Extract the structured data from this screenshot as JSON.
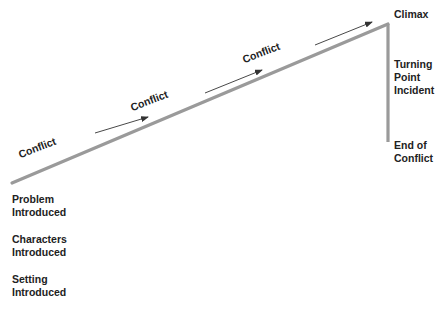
{
  "diagram": {
    "type": "plot-structure-line",
    "colors": {
      "line": "#9a9a9a",
      "arrow": "#333333",
      "text": "#222222",
      "background": "#ffffff"
    },
    "points": {
      "start": [
        12,
        183
      ],
      "climax": [
        388,
        24
      ],
      "end": [
        388,
        142
      ]
    },
    "conflicts": [
      {
        "label": "Conflict",
        "text_x": 21,
        "text_y": 160,
        "arrow_from": [
          95,
          133
        ],
        "arrow_to": [
          148,
          117
        ]
      },
      {
        "label": "Conflict",
        "text_x": 133,
        "text_y": 113,
        "arrow_from": [
          205,
          93
        ],
        "arrow_to": [
          262,
          70
        ]
      },
      {
        "label": "Conflict",
        "text_x": 245,
        "text_y": 64,
        "arrow_from": [
          315,
          45
        ],
        "arrow_to": [
          372,
          22
        ]
      }
    ],
    "left_labels": [
      {
        "lines": [
          "Problem",
          "Introduced"
        ]
      },
      {
        "lines": [
          "Characters",
          "Introduced"
        ]
      },
      {
        "lines": [
          "Setting",
          "Introduced"
        ]
      }
    ],
    "right_labels": {
      "climax": {
        "lines": [
          "Climax"
        ]
      },
      "turning_point": {
        "lines": [
          "Turning",
          "Point",
          "Incident"
        ]
      },
      "end": {
        "lines": [
          "End of",
          "Conflict"
        ]
      }
    }
  }
}
